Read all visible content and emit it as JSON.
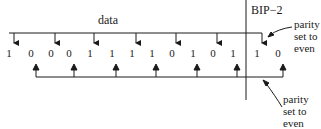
{
  "title_label": "data",
  "section_label": "BIP−2",
  "bits": [
    "1",
    "0",
    "0",
    "0",
    "1",
    "1",
    "1",
    "1",
    "0",
    "1",
    "0",
    "1",
    "1",
    "0"
  ],
  "bit_x": [
    9,
    31,
    51,
    69,
    90,
    112,
    132,
    152,
    172,
    193,
    213,
    233,
    257,
    278
  ],
  "top_annotation": {
    "line1": "parity",
    "line2": "set to",
    "line3": "even"
  },
  "bottom_annotation": {
    "line1": "parity",
    "line2": "set to",
    "line3": "even"
  },
  "top_bracket_arrow_bits": [
    0,
    2,
    4,
    6,
    8,
    10,
    12
  ],
  "bottom_bracket_arrow_bits": [
    1,
    3,
    5,
    7,
    9,
    11,
    13
  ],
  "colors": {
    "ink": "#1a1a1a",
    "background": "#ffffff"
  }
}
